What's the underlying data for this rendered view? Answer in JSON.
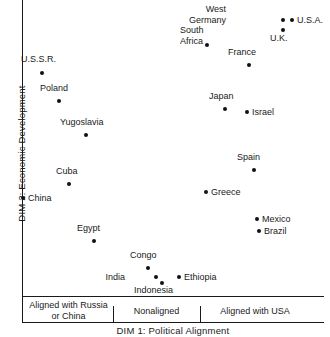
{
  "chart_data": {
    "type": "scatter",
    "title": "",
    "xlabel": "DIM 1:  Political Alignment",
    "ylabel": "DIM 2:  Economic Development",
    "xlim": [
      0,
      100
    ],
    "ylim": [
      0,
      100
    ],
    "grid": false,
    "legend": "none",
    "x_categories": [
      "Aligned with Russia\nor China",
      "Nonaligned",
      "Aligned with USA"
    ],
    "annotations": [],
    "points": [
      {
        "label": "U.S.S.R.",
        "x": 7,
        "y": 77,
        "px": 42,
        "py": 73,
        "lx": 21,
        "ly": 54,
        "align": "l"
      },
      {
        "label": "Poland",
        "x": 13,
        "y": 68,
        "px": 59,
        "py": 101,
        "lx": 40,
        "ly": 83,
        "align": "l"
      },
      {
        "label": "Yugoslavia",
        "x": 22,
        "y": 57,
        "px": 86,
        "py": 135,
        "lx": 60,
        "ly": 117,
        "align": "l"
      },
      {
        "label": "Cuba",
        "x": 16,
        "y": 38,
        "px": 69,
        "py": 184,
        "lx": 56,
        "ly": 166,
        "align": "l"
      },
      {
        "label": "China",
        "x": 1,
        "y": 34,
        "px": 23,
        "py": 198,
        "lx": 28,
        "ly": 193,
        "align": "l"
      },
      {
        "label": "Egypt",
        "x": 24,
        "y": 21,
        "px": 94,
        "py": 241,
        "lx": 77,
        "ly": 223,
        "align": "l"
      },
      {
        "label": "Congo",
        "x": 42,
        "y": 13,
        "px": 148,
        "py": 268,
        "lx": 130,
        "ly": 250,
        "align": "l"
      },
      {
        "label": "India",
        "x": 44,
        "y": 10,
        "px": 156,
        "py": 277,
        "lx": 125,
        "ly": 272,
        "align": "r"
      },
      {
        "label": "Indonesia",
        "x": 46,
        "y": 9,
        "px": 162,
        "py": 283,
        "lx": 134,
        "ly": 285,
        "align": "l"
      },
      {
        "label": "Ethiopia",
        "x": 52,
        "y": 10,
        "px": 179,
        "py": 277,
        "lx": 184,
        "ly": 272,
        "align": "l"
      },
      {
        "label": "Greece",
        "x": 61,
        "y": 36,
        "px": 206,
        "py": 192,
        "lx": 211,
        "ly": 187,
        "align": "l"
      },
      {
        "label": "Spain",
        "x": 77,
        "y": 44,
        "px": 254,
        "py": 170,
        "lx": 237,
        "ly": 152,
        "align": "l"
      },
      {
        "label": "Mexico",
        "x": 78,
        "y": 28,
        "px": 257,
        "py": 219,
        "lx": 262,
        "ly": 214,
        "align": "l"
      },
      {
        "label": "Brazil",
        "x": 79,
        "y": 24,
        "px": 259,
        "py": 231,
        "lx": 264,
        "ly": 226,
        "align": "l"
      },
      {
        "label": "Japan",
        "x": 67,
        "y": 63,
        "px": 225,
        "py": 109,
        "lx": 209,
        "ly": 91,
        "align": "l"
      },
      {
        "label": "Israel",
        "x": 74,
        "y": 62,
        "px": 247,
        "py": 112,
        "lx": 252,
        "ly": 107,
        "align": "l"
      },
      {
        "label": "South\nAfrica",
        "x": 62,
        "y": 84,
        "px": 207,
        "py": 45,
        "lx": 180,
        "ly": 25,
        "align": "l"
      },
      {
        "label": "France",
        "x": 76,
        "y": 77,
        "px": 249,
        "py": 65,
        "lx": 228,
        "ly": 47,
        "align": "l"
      },
      {
        "label": "West\nGermany",
        "x": 87,
        "y": 91,
        "px": 283,
        "py": 20,
        "lx": 226,
        "ly": 4,
        "align": "r"
      },
      {
        "label": "U.S.A.",
        "x": 90,
        "y": 91,
        "px": 292,
        "py": 20,
        "lx": 297,
        "ly": 15,
        "align": "l"
      },
      {
        "label": "U.K.",
        "x": 87,
        "y": 88,
        "px": 283,
        "py": 30,
        "lx": 270,
        "ly": 33,
        "align": "l"
      }
    ]
  }
}
